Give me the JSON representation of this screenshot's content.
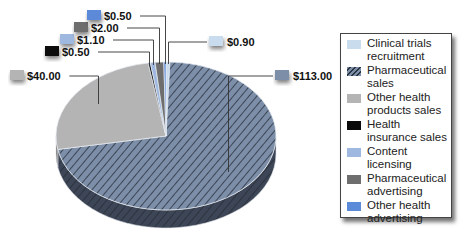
{
  "chart_data": {
    "type": "pie",
    "title": "",
    "style": "3d",
    "start_order": "clockwise-from-top",
    "slices": [
      {
        "name": "Clinical trials recruitment",
        "value": 0.9,
        "label": "$0.90",
        "color": "#c9dcee",
        "pattern": "none",
        "label_side": "right"
      },
      {
        "name": "Pharmaceutical sales",
        "value": 113.0,
        "label": "$113.00",
        "color": "#7d8ea8",
        "pattern": "diagonal-hatch",
        "label_side": "right"
      },
      {
        "name": "Other health products sales",
        "value": 40.0,
        "label": "$40.00",
        "color": "#b4b4b4",
        "pattern": "none",
        "label_side": "left"
      },
      {
        "name": "Health insurance sales",
        "value": 0.5,
        "label": "$0.50",
        "color": "#0a0a0a",
        "pattern": "none",
        "label_side": "left"
      },
      {
        "name": "Content licensing",
        "value": 1.1,
        "label": "$1.10",
        "color": "#9fb8e0",
        "pattern": "none",
        "label_side": "left"
      },
      {
        "name": "Pharmaceutical advertising",
        "value": 2.0,
        "label": "$2.00",
        "color": "#6e6e6e",
        "pattern": "none",
        "label_side": "left"
      },
      {
        "name": "Other health advertising",
        "value": 0.5,
        "label": "$0.50",
        "color": "#5b8ad8",
        "pattern": "none",
        "label_side": "left"
      }
    ],
    "legend_position": "right",
    "units": "USD"
  },
  "legend": {
    "items": [
      {
        "label": "Clinical trials recruitment",
        "color": "#c9dcee",
        "pattern": "none"
      },
      {
        "label": "Pharmaceutical sales",
        "color": "#7d8ea8",
        "pattern": "diagonal-hatch"
      },
      {
        "label": "Other health products sales",
        "color": "#b4b4b4",
        "pattern": "none"
      },
      {
        "label": "Health insurance sales",
        "color": "#0a0a0a",
        "pattern": "none"
      },
      {
        "label": "Content licensing",
        "color": "#9fb8e0",
        "pattern": "none"
      },
      {
        "label": "Pharmaceutical advertising",
        "color": "#6e6e6e",
        "pattern": "none"
      },
      {
        "label": "Other health advertising",
        "color": "#5b8ad8",
        "pattern": "none"
      }
    ]
  }
}
